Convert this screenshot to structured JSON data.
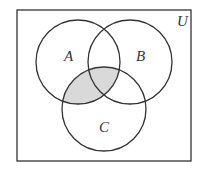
{
  "diagram": {
    "type": "venn",
    "universe_label": "U",
    "sets": [
      {
        "label": "A"
      },
      {
        "label": "B"
      },
      {
        "label": "C"
      }
    ],
    "shaded_region": "A ∩ C",
    "colors": {
      "stroke": "#333333",
      "shade": "#d9d9d9",
      "background": "#ffffff"
    }
  }
}
